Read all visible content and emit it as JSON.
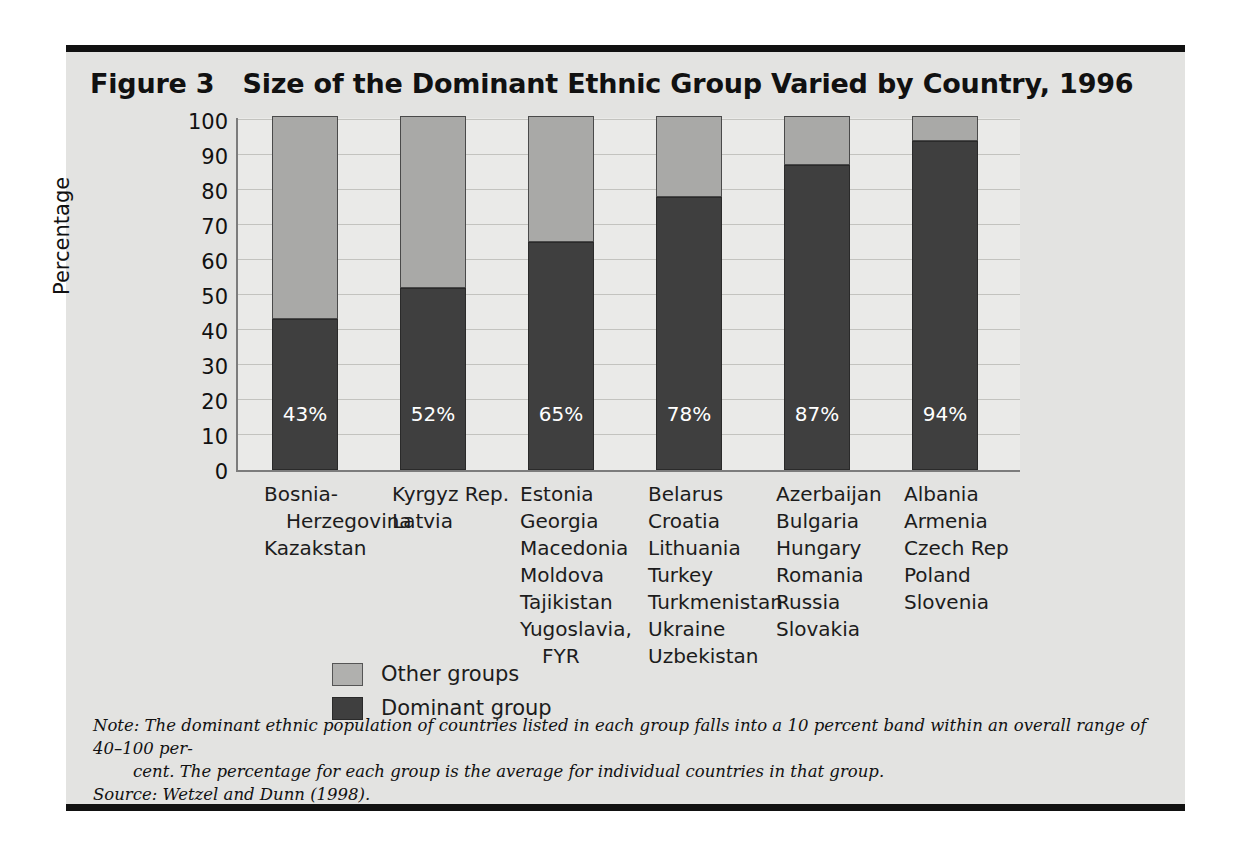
{
  "figure": {
    "number": "Figure 3",
    "title": "Size of the Dominant Ethnic Group Varied by Country, 1996"
  },
  "note": {
    "line1": "Note: The dominant ethnic population of countries listed in each group falls into a 10 percent band within an overall range of 40–100 per-",
    "line2": "cent. The percentage for each group is the average for individual countries in that group.",
    "source": "Source:  Wetzel and Dunn (1998)."
  },
  "legend": {
    "items": [
      {
        "label": "Other groups",
        "color": "#b0b0ae",
        "key": "other"
      },
      {
        "label": "Dominant group",
        "color": "#3f3f3f",
        "key": "dominant"
      }
    ]
  },
  "chart_data": {
    "type": "bar",
    "subtype": "stacked-100",
    "title": "Size of the Dominant Ethnic Group Varied by Country, 1996",
    "xlabel": "",
    "ylabel": "Percentage",
    "ylim": [
      0,
      100
    ],
    "yticks": [
      0,
      10,
      20,
      30,
      40,
      50,
      60,
      70,
      80,
      90,
      100
    ],
    "ytick_labels": [
      "0",
      "10",
      "20",
      "30",
      "40",
      "50",
      "60",
      "70",
      "80",
      "90",
      "100"
    ],
    "grid": true,
    "legend_position": "bottom-left",
    "categories": [
      "Group 1",
      "Group 2",
      "Group 3",
      "Group 4",
      "Group 5",
      "Group 6"
    ],
    "series": [
      {
        "name": "Dominant group",
        "color": "#3f3f3f",
        "values": [
          43,
          52,
          65,
          78,
          87,
          94
        ]
      },
      {
        "name": "Other groups",
        "color": "#a9a9a7",
        "values": [
          57,
          48,
          35,
          22,
          13,
          6
        ]
      }
    ],
    "data_labels": [
      "43%",
      "52%",
      "65%",
      "78%",
      "87%",
      "94%"
    ],
    "groups": [
      {
        "value": 43,
        "value_label": "43%",
        "countries": [
          {
            "name": "Bosnia-",
            "indent": false
          },
          {
            "name": "Herzegovina",
            "indent": true
          },
          {
            "name": "Kazakstan",
            "indent": false
          }
        ]
      },
      {
        "value": 52,
        "value_label": "52%",
        "countries": [
          {
            "name": "Kyrgyz Rep.",
            "indent": false
          },
          {
            "name": "Latvia",
            "indent": false
          }
        ]
      },
      {
        "value": 65,
        "value_label": "65%",
        "countries": [
          {
            "name": "Estonia",
            "indent": false
          },
          {
            "name": "Georgia",
            "indent": false
          },
          {
            "name": "Macedonia",
            "indent": false
          },
          {
            "name": "Moldova",
            "indent": false
          },
          {
            "name": "Tajikistan",
            "indent": false
          },
          {
            "name": "Yugoslavia,",
            "indent": false
          },
          {
            "name": "FYR",
            "indent": true
          }
        ]
      },
      {
        "value": 78,
        "value_label": "78%",
        "countries": [
          {
            "name": "Belarus",
            "indent": false
          },
          {
            "name": "Croatia",
            "indent": false
          },
          {
            "name": "Lithuania",
            "indent": false
          },
          {
            "name": "Turkey",
            "indent": false
          },
          {
            "name": "Turkmenistan",
            "indent": false
          },
          {
            "name": "Ukraine",
            "indent": false
          },
          {
            "name": "Uzbekistan",
            "indent": false
          }
        ]
      },
      {
        "value": 87,
        "value_label": "87%",
        "countries": [
          {
            "name": "Azerbaijan",
            "indent": false
          },
          {
            "name": "Bulgaria",
            "indent": false
          },
          {
            "name": "Hungary",
            "indent": false
          },
          {
            "name": "Romania",
            "indent": false
          },
          {
            "name": "Russia",
            "indent": false
          },
          {
            "name": "Slovakia",
            "indent": false
          }
        ]
      },
      {
        "value": 94,
        "value_label": "94%",
        "countries": [
          {
            "name": "Albania",
            "indent": false
          },
          {
            "name": "Armenia",
            "indent": false
          },
          {
            "name": "Czech Rep",
            "indent": false
          },
          {
            "name": "Poland",
            "indent": false
          },
          {
            "name": "Slovenia",
            "indent": false
          }
        ]
      }
    ]
  }
}
